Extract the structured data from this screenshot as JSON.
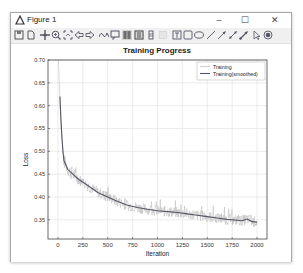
{
  "window": {
    "title": "Figure 1",
    "controls": {
      "minimize": "–",
      "maximize": "☐",
      "close": "✕"
    }
  },
  "toolbar": {
    "items": [
      {
        "icon": "save-icon"
      },
      {
        "icon": "new-document-icon"
      },
      {
        "icon": "pan-icon"
      },
      {
        "icon": "zoom-icon"
      },
      {
        "icon": "fit-icon"
      },
      {
        "icon": "back-arrow-icon"
      },
      {
        "icon": "forward-arrow-icon"
      },
      {
        "icon": "data-cursor-icon"
      },
      {
        "icon": "datatip-icon"
      },
      {
        "icon": "grid-icon"
      },
      {
        "icon": "legend-icon"
      },
      {
        "icon": "colorbar-icon"
      },
      {
        "icon": "blank-icon"
      },
      {
        "icon": "textbox-icon"
      },
      {
        "icon": "rectangle-icon"
      },
      {
        "icon": "ellipse-icon"
      },
      {
        "icon": "line-icon"
      },
      {
        "icon": "arrow-icon"
      },
      {
        "icon": "double-arrow-icon"
      },
      {
        "icon": "text-arrow-icon"
      },
      {
        "icon": "pointer-icon"
      },
      {
        "icon": "record-icon"
      }
    ]
  },
  "chart_data": {
    "type": "line",
    "title": "Training Progress",
    "xlabel": "Iteration",
    "ylabel": "Loss",
    "xlim": [
      -100,
      2100
    ],
    "ylim": [
      0.308,
      0.7
    ],
    "xticks": [
      0,
      250,
      500,
      750,
      1000,
      1250,
      1500,
      1750,
      2000
    ],
    "xtick_labels": [
      "0",
      "250",
      "500",
      "750",
      "1000",
      "1250",
      "1500",
      "1750",
      "2000"
    ],
    "yticks": [
      0.35,
      0.4,
      0.45,
      0.5,
      0.55,
      0.6,
      0.65,
      0.7
    ],
    "ytick_labels": [
      "0.35",
      "0.40",
      "0.45",
      "0.50",
      "0.55",
      "0.60",
      "0.65",
      "0.70"
    ],
    "grid": true,
    "legend": {
      "position": "upper right",
      "entries": [
        "Training",
        "Training(smoothed)"
      ]
    },
    "series": [
      {
        "name": "Training(smoothed)",
        "color": "#555566",
        "x": [
          20,
          30,
          40,
          50,
          60,
          80,
          100,
          150,
          200,
          300,
          400,
          500,
          600,
          700,
          800,
          900,
          1000,
          1100,
          1200,
          1300,
          1400,
          1500,
          1600,
          1700,
          1800,
          1850,
          1900,
          1950,
          2000
        ],
        "y": [
          0.62,
          0.57,
          0.53,
          0.5,
          0.48,
          0.47,
          0.46,
          0.45,
          0.44,
          0.425,
          0.41,
          0.4,
          0.39,
          0.382,
          0.377,
          0.373,
          0.37,
          0.368,
          0.366,
          0.363,
          0.36,
          0.357,
          0.354,
          0.351,
          0.349,
          0.348,
          0.352,
          0.346,
          0.345
        ]
      },
      {
        "name": "Training",
        "color": "#b8b8b8",
        "noise_amplitude": 0.012,
        "x_range": [
          0,
          2000
        ],
        "note": "raw noisy loss around smoothed curve, starting near 0.70"
      }
    ]
  }
}
